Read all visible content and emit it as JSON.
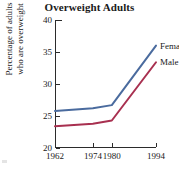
{
  "chart_data": {
    "type": "line",
    "title": "Overweight Adults",
    "xlabel": "",
    "ylabel": "Percentage of adults who are overweight",
    "ylabel_line1": "Percentage of adults",
    "ylabel_line2": "who are overweight",
    "x": [
      1962,
      1974,
      1980,
      1994
    ],
    "categories": [
      "1962",
      "1974",
      "1980",
      "1994"
    ],
    "xtick_labels": [
      "1962",
      "1974",
      "1980",
      "1994"
    ],
    "ytick_labels": [
      "20",
      "25",
      "30",
      "35",
      "40"
    ],
    "yticks": [
      20,
      25,
      30,
      35,
      40
    ],
    "ylim": [
      20,
      40
    ],
    "xlim": [
      1962,
      1994
    ],
    "grid": false,
    "legend_position": "inline-right",
    "series": [
      {
        "name": "Female",
        "label": "Female",
        "color": "#4a6b9e",
        "values": [
          25.8,
          26.2,
          26.7,
          36.0
        ]
      },
      {
        "name": "Male",
        "label": "Male",
        "color": "#a83050",
        "values": [
          23.4,
          23.8,
          24.3,
          33.4
        ]
      }
    ]
  },
  "axes": {
    "tick_color": "#2b2b2b",
    "axis_color": "#2b2b2b"
  }
}
